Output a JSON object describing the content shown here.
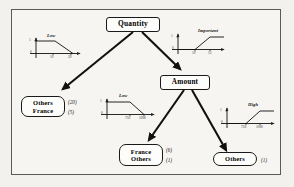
{
  "diagram": {
    "type": "decision-tree",
    "border_color": "#5a5a5a",
    "background": "#f6f5f2",
    "node_border_color": "#1a1a1a",
    "arrow_color": "#111111"
  },
  "nodes": {
    "root": {
      "label": "Quantity"
    },
    "amount": {
      "label": "Amount"
    },
    "leaf_left": {
      "line1": "Others",
      "line2": "France",
      "count1": "(20)",
      "count2": "(5)"
    },
    "leaf_mid": {
      "line1": "France",
      "line2": "Others",
      "count1": "(6)",
      "count2": "(1)"
    },
    "leaf_right": {
      "label": "Others",
      "count": "(1)"
    }
  },
  "fuzzy_charts": [
    {
      "id": "chart-low-left",
      "term": "Low",
      "shape": "descending",
      "y_axis_label": "1",
      "y_origin_label": "0",
      "tick_labels": [
        "10",
        "20"
      ]
    },
    {
      "id": "chart-important",
      "term": "Important",
      "shape": "ascending",
      "y_axis_label": "1",
      "y_origin_label": "0",
      "tick_labels": [
        "10",
        "15"
      ]
    },
    {
      "id": "chart-low-mid",
      "term": "Low",
      "shape": "descending",
      "y_axis_label": "1",
      "y_origin_label": "0",
      "tick_labels": [
        "750",
        "1000"
      ]
    },
    {
      "id": "chart-high",
      "term": "High",
      "shape": "ascending",
      "y_axis_label": "1",
      "y_origin_label": "0",
      "tick_labels": [
        "750",
        "1000"
      ]
    }
  ],
  "edges": [
    {
      "from": "Quantity",
      "to": "Others / France",
      "condition": "Low"
    },
    {
      "from": "Quantity",
      "to": "Amount",
      "condition": "Important"
    },
    {
      "from": "Amount",
      "to": "France / Others",
      "condition": "Low"
    },
    {
      "from": "Amount",
      "to": "Others",
      "condition": "High"
    }
  ]
}
